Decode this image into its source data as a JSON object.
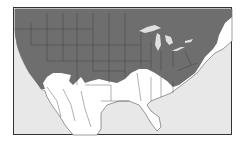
{
  "map": {
    "type": "choropleth",
    "region": "United States and northern Mexico",
    "colors": {
      "range": "#6e6e6e",
      "outside_range": "#ffffff",
      "water": "#e8e8e8",
      "borders": "#3a3a3a",
      "lakes": "#e0e0e0"
    },
    "legend": []
  }
}
